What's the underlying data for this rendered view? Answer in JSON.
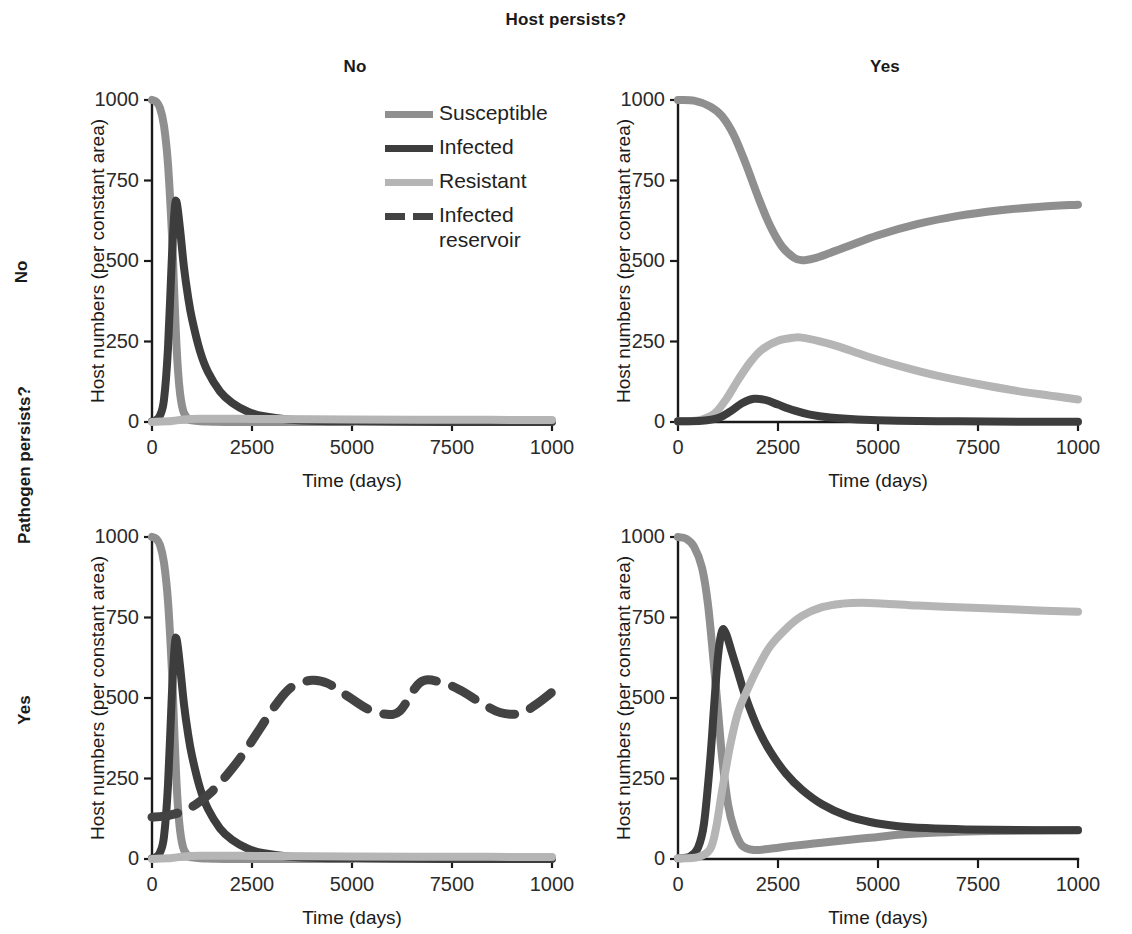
{
  "figure": {
    "column_axis_title": "Host persists?",
    "column_labels": [
      "No",
      "Yes"
    ],
    "row_axis_title": "Pathogen persists?",
    "row_labels": [
      "No",
      "Yes"
    ]
  },
  "legend": {
    "items": [
      {
        "label": "Susceptible",
        "color": "#8f8f8f",
        "style": "solid",
        "key": "susceptible"
      },
      {
        "label": "Infected",
        "color": "#3d3d3d",
        "style": "solid",
        "key": "infected"
      },
      {
        "label": "Resistant",
        "color": "#b5b5b5",
        "style": "solid",
        "key": "resistant"
      },
      {
        "label": "Infected",
        "label2": "reservoir",
        "color": "#434343",
        "style": "dashed",
        "key": "infected_reservoir"
      }
    ]
  },
  "axes": {
    "xlabel": "Time (days)",
    "ylabel": "Host numbers (per constant area)",
    "xticks": [
      0,
      2500,
      5000,
      7500,
      10000
    ],
    "xticklabels": [
      "0",
      "2500",
      "5000",
      "7500",
      "1000"
    ],
    "yticks": [
      0,
      250,
      500,
      750,
      1000
    ],
    "yticklabels": [
      "0",
      "250",
      "500",
      "750",
      "1000"
    ],
    "xlim": [
      0,
      10000
    ],
    "ylim": [
      0,
      1000
    ],
    "grid": false
  },
  "chart_data": [
    {
      "panel_id": "top-left",
      "type": "line",
      "row": "No",
      "column": "No",
      "title": "Pathogen persists? No / Host persists? No",
      "xlabel": "Time (days)",
      "ylabel": "Host numbers (per constant area)",
      "xlim": [
        0,
        10000
      ],
      "ylim": [
        0,
        1000
      ],
      "grid": false,
      "series": [
        {
          "name": "Susceptible",
          "color": "#8f8f8f",
          "style": "solid",
          "x": [
            0,
            100,
            200,
            300,
            400,
            500,
            550,
            600,
            650,
            700,
            750,
            800,
            900,
            1000,
            1200,
            1500,
            2000,
            3000,
            5000,
            7500,
            10000
          ],
          "y": [
            1000,
            995,
            975,
            920,
            800,
            580,
            420,
            270,
            160,
            90,
            50,
            28,
            10,
            5,
            2,
            1,
            0,
            0,
            0,
            0
          ]
        },
        {
          "name": "Infected",
          "color": "#3d3d3d",
          "style": "solid",
          "x": [
            0,
            100,
            200,
            300,
            400,
            500,
            570,
            620,
            700,
            800,
            900,
            1000,
            1200,
            1400,
            1700,
            2000,
            2400,
            2800,
            3400,
            4200,
            5000,
            6000,
            8000,
            10000
          ],
          "y": [
            2,
            6,
            20,
            70,
            230,
            520,
            665,
            680,
            600,
            480,
            390,
            320,
            220,
            155,
            95,
            60,
            32,
            18,
            8,
            3,
            2,
            1,
            0,
            0
          ]
        },
        {
          "name": "Resistant",
          "color": "#b5b5b5",
          "style": "solid",
          "x": [
            0,
            500,
            800,
            1200,
            2000,
            3000,
            5000,
            7500,
            10000
          ],
          "y": [
            0,
            3,
            8,
            10,
            10,
            9,
            8,
            7,
            6
          ]
        }
      ]
    },
    {
      "panel_id": "top-right",
      "type": "line",
      "row": "No",
      "column": "Yes",
      "title": "Pathogen persists? No / Host persists? Yes",
      "xlabel": "Time (days)",
      "ylabel": "Host numbers (per constant area)",
      "xlim": [
        0,
        10000
      ],
      "ylim": [
        0,
        1000
      ],
      "grid": false,
      "series": [
        {
          "name": "Susceptible",
          "color": "#8f8f8f",
          "style": "solid",
          "x": [
            0,
            400,
            800,
            1100,
            1400,
            1700,
            2000,
            2300,
            2600,
            2900,
            3100,
            3400,
            3800,
            4300,
            5000,
            6000,
            7000,
            8000,
            9000,
            10000
          ],
          "y": [
            1000,
            998,
            980,
            950,
            890,
            800,
            700,
            610,
            545,
            510,
            502,
            508,
            525,
            548,
            580,
            615,
            640,
            657,
            668,
            675
          ]
        },
        {
          "name": "Resistant",
          "color": "#b5b5b5",
          "style": "solid",
          "x": [
            0,
            500,
            900,
            1200,
            1500,
            1800,
            2100,
            2500,
            2900,
            3100,
            3500,
            4000,
            4700,
            5500,
            6500,
            7500,
            8500,
            9300,
            10000
          ],
          "y": [
            2,
            5,
            25,
            70,
            130,
            185,
            225,
            252,
            262,
            262,
            252,
            235,
            205,
            175,
            143,
            118,
            96,
            82,
            70
          ]
        },
        {
          "name": "Infected",
          "color": "#3d3d3d",
          "style": "solid",
          "x": [
            0,
            600,
            1000,
            1300,
            1600,
            1900,
            2200,
            2500,
            2900,
            3300,
            3800,
            4500,
            5500,
            7000,
            8500,
            10000
          ],
          "y": [
            2,
            4,
            12,
            32,
            58,
            72,
            68,
            54,
            36,
            23,
            14,
            8,
            4,
            2,
            1,
            1
          ]
        }
      ]
    },
    {
      "panel_id": "bottom-left",
      "type": "line",
      "row": "Yes",
      "column": "No",
      "title": "Pathogen persists? Yes / Host persists? No",
      "xlabel": "Time (days)",
      "ylabel": "Host numbers (per constant area)",
      "xlim": [
        0,
        10000
      ],
      "ylim": [
        0,
        1000
      ],
      "grid": false,
      "series": [
        {
          "name": "Susceptible",
          "color": "#8f8f8f",
          "style": "solid",
          "x": [
            0,
            100,
            200,
            300,
            400,
            500,
            550,
            600,
            650,
            700,
            750,
            800,
            900,
            1000,
            1200,
            1500,
            2000,
            3000,
            5000,
            7500,
            10000
          ],
          "y": [
            1000,
            995,
            975,
            920,
            800,
            580,
            420,
            270,
            160,
            90,
            50,
            28,
            10,
            5,
            2,
            1,
            0,
            0,
            0,
            0
          ]
        },
        {
          "name": "Infected",
          "color": "#3d3d3d",
          "style": "solid",
          "x": [
            0,
            100,
            200,
            300,
            400,
            500,
            570,
            620,
            700,
            800,
            900,
            1000,
            1200,
            1400,
            1700,
            2000,
            2400,
            2800,
            3400,
            4200,
            5000,
            6000,
            8000,
            10000
          ],
          "y": [
            2,
            6,
            20,
            70,
            230,
            520,
            665,
            680,
            600,
            480,
            390,
            320,
            220,
            155,
            95,
            60,
            32,
            18,
            8,
            3,
            2,
            1,
            0,
            0
          ]
        },
        {
          "name": "Resistant",
          "color": "#b5b5b5",
          "style": "solid",
          "x": [
            0,
            500,
            800,
            1200,
            2000,
            3000,
            5000,
            7500,
            10000
          ],
          "y": [
            0,
            3,
            8,
            10,
            10,
            9,
            8,
            7,
            6
          ]
        },
        {
          "name": "Infected reservoir",
          "color": "#434343",
          "style": "dashed",
          "x": [
            0,
            300,
            700,
            1100,
            1500,
            1900,
            2300,
            2700,
            3100,
            3500,
            4000,
            4400,
            4900,
            5400,
            5800,
            6200,
            6700,
            7200,
            7700,
            8200,
            8700,
            9200,
            9600,
            10000
          ],
          "y": [
            130,
            133,
            145,
            170,
            210,
            265,
            330,
            405,
            480,
            535,
            555,
            545,
            505,
            465,
            450,
            460,
            548,
            550,
            525,
            487,
            455,
            452,
            480,
            518
          ]
        }
      ]
    },
    {
      "panel_id": "bottom-right",
      "type": "line",
      "row": "Yes",
      "column": "Yes",
      "title": "Pathogen persists? Yes / Host persists? Yes",
      "xlabel": "Time (days)",
      "ylabel": "Host numbers (per constant area)",
      "xlim": [
        0,
        10000
      ],
      "ylim": [
        0,
        1000
      ],
      "grid": false,
      "series": [
        {
          "name": "Susceptible",
          "color": "#8f8f8f",
          "style": "solid",
          "x": [
            0,
            200,
            400,
            600,
            750,
            900,
            1000,
            1100,
            1250,
            1400,
            1600,
            1900,
            2300,
            2800,
            3400,
            4000,
            4800,
            5600,
            6500,
            7500,
            8500,
            10000
          ],
          "y": [
            1000,
            995,
            970,
            905,
            790,
            600,
            460,
            320,
            170,
            95,
            42,
            28,
            32,
            40,
            48,
            56,
            66,
            76,
            82,
            86,
            88,
            90
          ]
        },
        {
          "name": "Infected",
          "color": "#3d3d3d",
          "style": "solid",
          "x": [
            0,
            300,
            500,
            650,
            800,
            900,
            1000,
            1100,
            1200,
            1350,
            1500,
            1700,
            2000,
            2300,
            2700,
            3100,
            3600,
            4200,
            4800,
            5500,
            6200,
            7200,
            8500,
            10000
          ],
          "y": [
            2,
            8,
            35,
            110,
            300,
            470,
            630,
            708,
            700,
            640,
            580,
            500,
            405,
            335,
            265,
            215,
            170,
            135,
            115,
            102,
            96,
            92,
            90,
            89
          ]
        },
        {
          "name": "Resistant",
          "color": "#b5b5b5",
          "style": "solid",
          "x": [
            0,
            500,
            800,
            950,
            1100,
            1300,
            1500,
            1750,
            2000,
            2300,
            2700,
            3100,
            3600,
            4100,
            4600,
            5200,
            6000,
            7000,
            8000,
            9000,
            10000
          ],
          "y": [
            2,
            6,
            30,
            95,
            210,
            350,
            455,
            530,
            595,
            660,
            715,
            755,
            782,
            793,
            796,
            793,
            787,
            782,
            777,
            772,
            768
          ]
        }
      ]
    }
  ]
}
